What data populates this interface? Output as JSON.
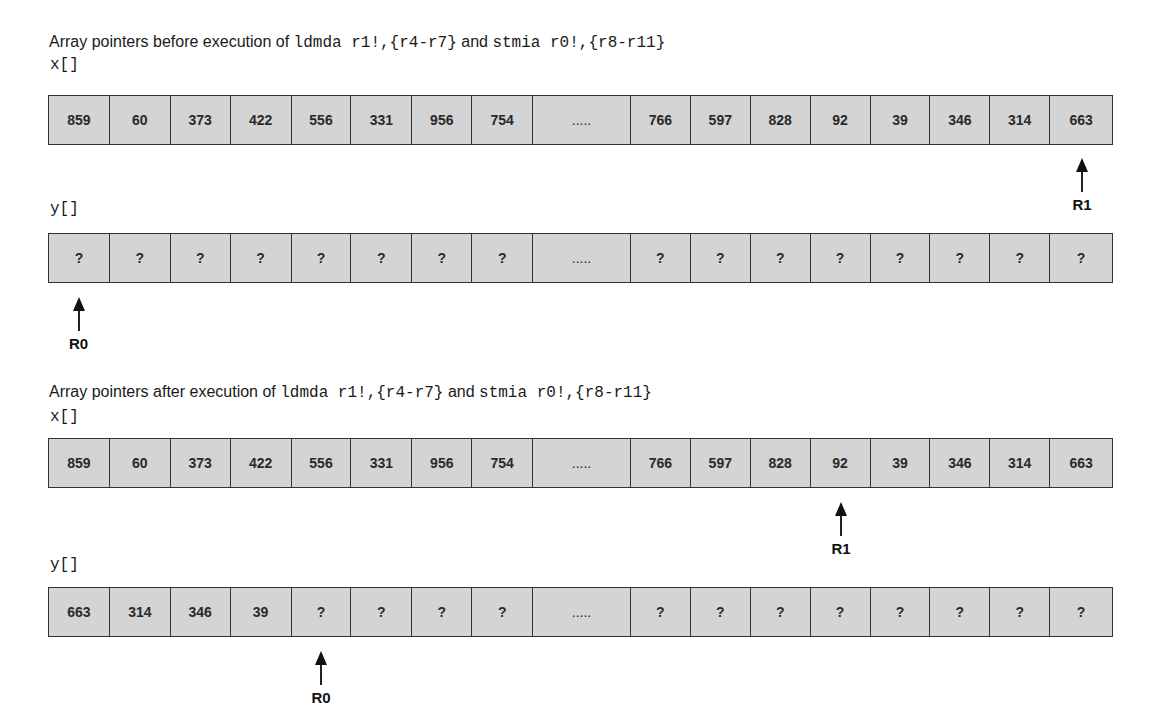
{
  "before": {
    "title_prefix": "Array pointers before execution of ",
    "instr1": "ldmda r1!,{r4-r7}",
    "conj": " and ",
    "instr2": "stmia r0!,{r8-r11}",
    "x_label": "x[]",
    "y_label": "y[]",
    "x_cells": [
      "859",
      "60",
      "373",
      "422",
      "556",
      "331",
      "956",
      "754",
      ".....",
      "766",
      "597",
      "828",
      "92",
      "39",
      "346",
      "314",
      "663"
    ],
    "y_cells": [
      "?",
      "?",
      "?",
      "?",
      "?",
      "?",
      "?",
      "?",
      ".....",
      "?",
      "?",
      "?",
      "?",
      "?",
      "?",
      "?",
      "?"
    ],
    "r1_label": "R1",
    "r1_index": 16,
    "r0_label": "R0",
    "r0_index": 0
  },
  "after": {
    "title_prefix": "Array pointers after execution of ",
    "instr1": "ldmda r1!,{r4-r7}",
    "conj": " and ",
    "instr2": "stmia r0!,{r8-r11}",
    "x_label": "x[]",
    "y_label": "y[]",
    "x_cells": [
      "859",
      "60",
      "373",
      "422",
      "556",
      "331",
      "956",
      "754",
      ".....",
      "766",
      "597",
      "828",
      "92",
      "39",
      "346",
      "314",
      "663"
    ],
    "y_cells": [
      "663",
      "314",
      "346",
      "39",
      "?",
      "?",
      "?",
      "?",
      ".....",
      "?",
      "?",
      "?",
      "?",
      "?",
      "?",
      "?",
      "?"
    ],
    "r1_label": "R1",
    "r1_index": 12,
    "r0_label": "R0",
    "r0_index": 4
  },
  "colors": {
    "cell_fill": "#d4d4d4",
    "cell_border": "#333333",
    "arrow": "#111111"
  }
}
